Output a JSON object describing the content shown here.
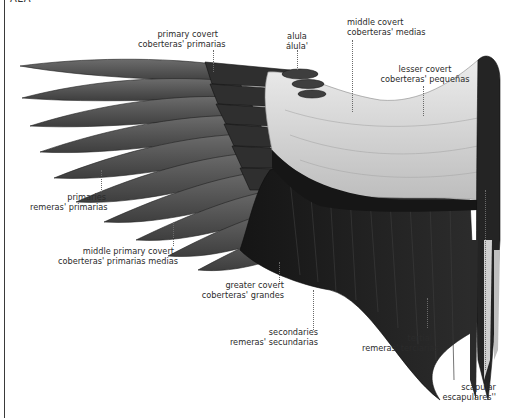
{
  "header": {
    "title": "ALA"
  },
  "diagram": {
    "colors": {
      "primaries": "#5a5a5a",
      "primary_coverts": "#2e2e2e",
      "lesser_coverts": "#d8d8d8",
      "secondaries": "#1e1e1e",
      "scapulars": "#c9c9c9",
      "background": "#ffffff"
    },
    "labels": [
      {
        "id": "primary-covert",
        "en": "primary covert",
        "es": "coberteras' primarias"
      },
      {
        "id": "alula",
        "en": "alula",
        "es": "álula'"
      },
      {
        "id": "middle-covert",
        "en": "middle covert",
        "es": "coberteras' medias"
      },
      {
        "id": "lesser-covert",
        "en": "lesser covert",
        "es": "coberteras' pequeñas"
      },
      {
        "id": "primaries",
        "en": "primaries",
        "es": "remeras' primarias"
      },
      {
        "id": "middle-primary-covert",
        "en": "middle primary covert",
        "es": "coberteras' primarias medias"
      },
      {
        "id": "greater-covert",
        "en": "greater covert",
        "es": "coberteras' grandes"
      },
      {
        "id": "secondaries",
        "en": "secondaries",
        "es": "remeras' secundarias"
      },
      {
        "id": "tertial",
        "en": "tertial",
        "es": "remeras' terciarias"
      },
      {
        "id": "scapular",
        "en": "scapular",
        "es": "escapulares''"
      }
    ]
  }
}
